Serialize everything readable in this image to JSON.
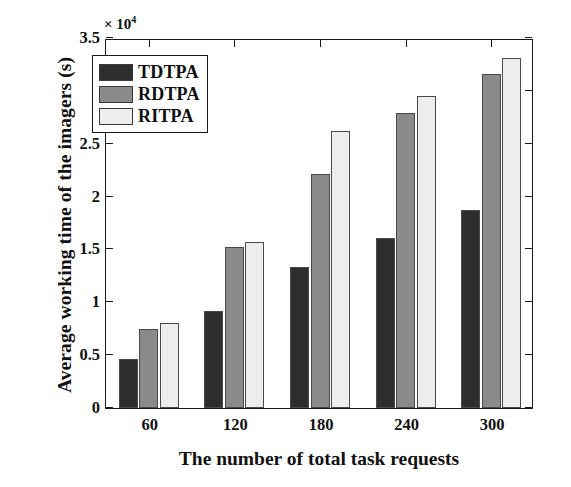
{
  "chart_data": {
    "type": "bar",
    "title": "",
    "xlabel": "The number of total task requests",
    "ylabel": "Average working time of the imagers (s)",
    "categories": [
      "60",
      "120",
      "180",
      "240",
      "300"
    ],
    "y_exponent_label": "× 10",
    "y_exponent_power": "4",
    "y_exponent_multiplier": 10000,
    "ylim": [
      0,
      3.5
    ],
    "yticks": [
      "0",
      "0.5",
      "1",
      "1.5",
      "2",
      "2.5",
      "3",
      "3.5"
    ],
    "ytick_values": [
      0,
      0.5,
      1,
      1.5,
      2,
      2.5,
      3,
      3.5
    ],
    "grid": false,
    "legend_position": "upper-left",
    "series": [
      {
        "name": "TDTPA",
        "color": "#2e2e2e",
        "values": [
          0.46,
          0.92,
          1.33,
          1.61,
          1.87
        ]
      },
      {
        "name": "RDTPA",
        "color": "#8a8a8a",
        "values": [
          0.75,
          1.52,
          2.21,
          2.79,
          3.16
        ]
      },
      {
        "name": "RITPA",
        "color": "#ededed",
        "values": [
          0.8,
          1.57,
          2.62,
          2.95,
          3.31
        ]
      }
    ]
  }
}
